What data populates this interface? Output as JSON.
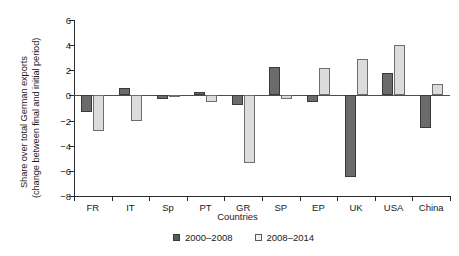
{
  "chart_data": {
    "type": "bar",
    "title": "",
    "xlabel": "Countries",
    "ylabel_line1": "Share over total German exports",
    "ylabel_line2": "(change between final and initial period)",
    "categories": [
      "FR",
      "IT",
      "Sp",
      "PT",
      "GR",
      "SP",
      "EP",
      "UK",
      "USA",
      "China"
    ],
    "series": [
      {
        "name": "2000–2008",
        "color": "#6b6b6b",
        "values": [
          -1.3,
          0.6,
          -0.3,
          0.3,
          -0.8,
          2.3,
          -0.5,
          -6.5,
          1.8,
          -2.6
        ]
      },
      {
        "name": "2008–2014",
        "color": "#dcdcdc",
        "values": [
          -2.8,
          -2.0,
          -0.05,
          -0.5,
          -5.4,
          -0.3,
          2.2,
          2.9,
          4.0,
          0.9
        ]
      }
    ],
    "ylim": [
      -8,
      6
    ],
    "yticks": [
      6,
      4,
      2,
      0,
      -2,
      -4,
      -6,
      -8
    ],
    "ytick_labels": [
      "6",
      "4",
      "2",
      "0",
      "−2",
      "−4",
      "−6",
      "−8"
    ],
    "grid": false,
    "legend_position": "bottom-center"
  }
}
